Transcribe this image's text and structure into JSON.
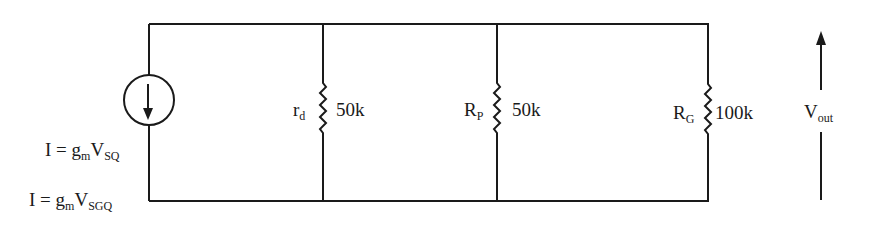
{
  "diagram": {
    "type": "circuit-schematic",
    "stroke_color": "#1a1a1a",
    "background": "#ffffff",
    "source": {
      "kind": "dependent-current-source",
      "direction": "down",
      "label1": {
        "prefix": "I = g",
        "sub1": "m",
        "mid": "V",
        "sub2": "SQ"
      },
      "label2": {
        "prefix": "I = g",
        "sub1": "m",
        "mid": "V",
        "sub2": "SGQ"
      }
    },
    "resistors": [
      {
        "name_main": "r",
        "name_sub": "d",
        "value": "50k"
      },
      {
        "name_main": "R",
        "name_sub": "P",
        "value": "50k"
      },
      {
        "name_main": "R",
        "name_sub": "G",
        "value": "100k"
      }
    ],
    "output": {
      "main": "V",
      "sub": "out",
      "arrow_direction": "up"
    }
  }
}
